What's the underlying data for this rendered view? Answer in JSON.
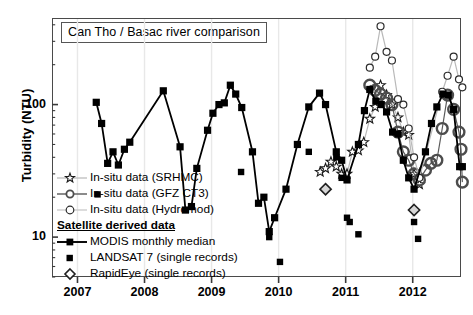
{
  "chart_data": {
    "type": "scatter",
    "title": "Can Tho / Basac river comparison",
    "xlabel": "",
    "ylabel": "Turbidity (NTU)",
    "yscale": "log",
    "ylim": [
      5,
      450
    ],
    "xlim": [
      2006.62,
      2012.72
    ],
    "grid": "faint vertical gridlines at each year",
    "legend_position": "inside lower-left",
    "ytick_labels": [
      "100",
      "10"
    ],
    "ytick_values": [
      100,
      10
    ],
    "xtick_labels": [
      "2007",
      "2008",
      "2009",
      "2010",
      "2011",
      "2012"
    ],
    "xtick_values": [
      2007,
      2008,
      2009,
      2010,
      2011,
      2012
    ],
    "series": [
      {
        "name": "In-situ data (SRHMC)",
        "marker": "open-star",
        "color": "#b4b4b4",
        "connected": true,
        "points": [
          [
            2010.62,
            31
          ],
          [
            2010.7,
            33
          ],
          [
            2010.78,
            37
          ],
          [
            2010.86,
            34
          ],
          [
            2010.94,
            30
          ],
          [
            2011.02,
            30
          ],
          [
            2011.1,
            44
          ],
          [
            2011.19,
            45
          ],
          [
            2011.27,
            52
          ],
          [
            2011.36,
            78
          ],
          [
            2011.44,
            96
          ],
          [
            2011.52,
            140
          ],
          [
            2011.61,
            118
          ],
          [
            2011.69,
            100
          ],
          [
            2011.78,
            80
          ],
          [
            2011.86,
            62
          ],
          [
            2011.94,
            59
          ],
          [
            2012.02,
            30
          ],
          [
            2012.1,
            25
          ]
        ]
      },
      {
        "name": "In-situ data (GFZ CT3)",
        "marker": "open-circle-gray-thick",
        "color": "#555555",
        "connected": true,
        "points": [
          [
            2011.36,
            140
          ],
          [
            2011.44,
            128
          ],
          [
            2011.52,
            120
          ],
          [
            2011.61,
            112
          ],
          [
            2011.69,
            100
          ],
          [
            2011.78,
            62
          ],
          [
            2011.86,
            44
          ],
          [
            2011.94,
            38
          ],
          [
            2012.02,
            30
          ],
          [
            2012.1,
            27
          ],
          [
            2012.19,
            32
          ],
          [
            2012.27,
            36
          ],
          [
            2012.36,
            38
          ],
          [
            2012.44,
            66
          ],
          [
            2012.52,
            118
          ],
          [
            2012.61,
            92
          ],
          [
            2012.69,
            62
          ],
          [
            2012.72,
            46
          ],
          [
            2012.74,
            26
          ]
        ]
      },
      {
        "name": "In-situ data (Hydromod)",
        "marker": "open-circle-small",
        "color": "#9a9a9a",
        "connected": true,
        "points": [
          [
            2011.36,
            190
          ],
          [
            2011.44,
            230
          ],
          [
            2011.52,
            390
          ],
          [
            2011.61,
            250
          ],
          [
            2011.69,
            215
          ],
          [
            2011.78,
            110
          ],
          [
            2011.86,
            100
          ],
          [
            2011.94,
            66
          ],
          [
            2012.02,
            40
          ],
          [
            2012.1,
            28
          ],
          [
            2012.44,
            125
          ],
          [
            2012.52,
            165
          ],
          [
            2012.61,
            230
          ],
          [
            2012.69,
            155
          ],
          [
            2012.74,
            135
          ]
        ]
      },
      {
        "name": "MODIS monthly median",
        "marker": "filled-square",
        "color": "#000000",
        "connected": true,
        "points": [
          [
            2007.28,
            104
          ],
          [
            2007.36,
            72
          ],
          [
            2007.45,
            36
          ],
          [
            2007.53,
            44
          ],
          [
            2007.61,
            35
          ],
          [
            2007.7,
            46
          ],
          [
            2007.78,
            52
          ],
          [
            2008.28,
            127
          ],
          [
            2008.53,
            48
          ],
          [
            2008.61,
            16
          ],
          [
            2008.7,
            17
          ],
          [
            2008.78,
            33
          ],
          [
            2008.94,
            64
          ],
          [
            2009.02,
            86
          ],
          [
            2009.11,
            100
          ],
          [
            2009.19,
            103
          ],
          [
            2009.28,
            140
          ],
          [
            2009.36,
            120
          ],
          [
            2009.45,
            95
          ],
          [
            2009.61,
            44
          ],
          [
            2009.7,
            18
          ],
          [
            2009.78,
            20
          ],
          [
            2009.86,
            11
          ],
          [
            2009.94,
            14
          ],
          [
            2010.11,
            23
          ],
          [
            2010.28,
            50
          ],
          [
            2010.45,
            96
          ],
          [
            2010.61,
            122
          ],
          [
            2010.7,
            100
          ],
          [
            2010.86,
            44
          ],
          [
            2010.94,
            38
          ],
          [
            2011.02,
            27
          ],
          [
            2011.19,
            50
          ],
          [
            2011.28,
            90
          ],
          [
            2011.36,
            130
          ],
          [
            2011.45,
            106
          ],
          [
            2011.53,
            100
          ],
          [
            2011.61,
            88
          ],
          [
            2011.7,
            62
          ],
          [
            2011.78,
            60
          ],
          [
            2011.86,
            38
          ],
          [
            2011.94,
            28
          ],
          [
            2012.02,
            23
          ],
          [
            2012.19,
            44
          ],
          [
            2012.28,
            72
          ],
          [
            2012.36,
            96
          ],
          [
            2012.45,
            120
          ],
          [
            2012.53,
            118
          ],
          [
            2012.61,
            92
          ],
          [
            2012.7,
            34
          ],
          [
            2012.74,
            34
          ]
        ]
      },
      {
        "name": "LANDSAT 7 (single records)",
        "marker": "filled-square-single",
        "color": "#000000",
        "connected": false,
        "points": [
          [
            2007.3,
            21
          ],
          [
            2009.44,
            31
          ],
          [
            2009.86,
            10
          ],
          [
            2010.02,
            6.5
          ],
          [
            2010.45,
            44
          ],
          [
            2010.86,
            40
          ],
          [
            2010.94,
            28
          ],
          [
            2011.02,
            14
          ],
          [
            2011.06,
            13
          ],
          [
            2011.19,
            10.5
          ],
          [
            2012.02,
            13
          ],
          [
            2012.08,
            9.7
          ]
        ]
      },
      {
        "name": "RapidEye (single records)",
        "marker": "open-diamond",
        "color": "#555555",
        "connected": false,
        "points": [
          [
            2010.7,
            23
          ],
          [
            2012.02,
            16
          ]
        ]
      }
    ]
  },
  "legend": {
    "items": [
      {
        "label": "In-situ data (SRHMC)",
        "key": "star-key"
      },
      {
        "label": "In-situ data (GFZ CT3)",
        "key": "circle-gray-key"
      },
      {
        "label": "In-situ data (Hydromod)",
        "key": "circle-open-key"
      },
      {
        "label": "Satellite derived data",
        "key": "header"
      },
      {
        "label": "MODIS monthly median",
        "key": "square-line-key"
      },
      {
        "label": "LANDSAT 7 (single records)",
        "key": "square-key"
      },
      {
        "label": "RapidEye (single records)",
        "key": "diamond-key"
      }
    ]
  }
}
